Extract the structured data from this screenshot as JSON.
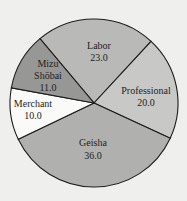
{
  "chart_data": {
    "type": "pie",
    "title": "",
    "categories": [
      "Labor",
      "Professional",
      "Geisha",
      "Merchant",
      "Mizu Shōbai"
    ],
    "values": [
      23.0,
      20.0,
      36.0,
      10.0,
      11.0
    ],
    "value_labels": [
      "23.0",
      "20.0",
      "36.0",
      "10.0",
      "11.0"
    ],
    "colors": [
      "#b9b9b7",
      "#c8c8c6",
      "#b0b0ae",
      "#fafaf8",
      "#979795"
    ],
    "label_lines": [
      [
        "Labor"
      ],
      [
        "Professional"
      ],
      [
        "Geisha"
      ],
      [
        "Merchant"
      ],
      [
        "Mizu",
        "Shōbai"
      ]
    ],
    "start_angle_deg": 230,
    "legend": "none"
  },
  "labels": {
    "labor_name": "Labor",
    "labor_value": "23.0",
    "professional_name": "Professional",
    "professional_value": "20.0",
    "geisha_name": "Geisha",
    "geisha_value": "36.0",
    "merchant_name": "Merchant",
    "merchant_value": "10.0",
    "mizu_line1": "Mizu",
    "mizu_line2": "Shōbai",
    "mizu_value": "11.0"
  }
}
